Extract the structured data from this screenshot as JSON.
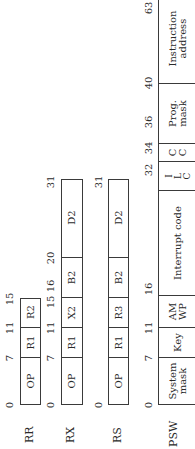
{
  "rows": [
    {
      "label": "RR",
      "bits": [
        "0",
        "7",
        "11",
        "15"
      ],
      "fields": [
        "OP",
        "R1",
        "R2"
      ]
    },
    {
      "label": "RX",
      "bits": [
        "0",
        "7",
        "11",
        "15",
        "16",
        "20",
        "31"
      ],
      "fields": [
        "OP",
        "R1",
        "X2",
        "B2",
        "D2"
      ]
    },
    {
      "label": "RS",
      "bits": [
        "0",
        "7",
        "11",
        "15",
        "16",
        "20",
        "31"
      ],
      "fields": [
        "OP",
        "R1",
        "R3",
        "B2",
        "D2"
      ]
    },
    {
      "label": "PSW",
      "bits": [
        "0",
        "7",
        "11",
        "16",
        "32",
        "34",
        "36",
        "40",
        "63"
      ],
      "fields": {
        "system_mask": [
          "System",
          "mask"
        ],
        "key": "Key",
        "am_wp": [
          "AM",
          "WP"
        ],
        "interrupt_code": "Interrupt code",
        "ilc": [
          "I",
          "L",
          "C"
        ],
        "cc": [
          "C",
          "C"
        ],
        "prog_mask": [
          "Prog.",
          "mask"
        ],
        "instruction_address": "Instruction address"
      }
    }
  ]
}
